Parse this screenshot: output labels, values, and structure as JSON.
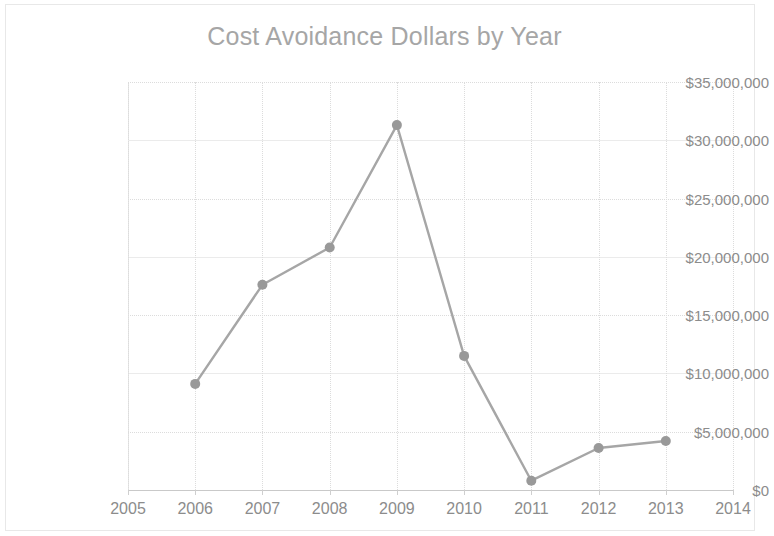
{
  "chart_data": {
    "type": "line",
    "title": "Cost Avoidance Dollars by Year",
    "xlabel": "",
    "ylabel": "",
    "x": [
      2006,
      2007,
      2008,
      2009,
      2010,
      2011,
      2012,
      2013
    ],
    "values": [
      9100000,
      17600000,
      20800000,
      31300000,
      11500000,
      800000,
      3600000,
      4200000
    ],
    "series": [
      {
        "name": "Cost Avoidance Dollars",
        "values": [
          9100000,
          17600000,
          20800000,
          31300000,
          11500000,
          800000,
          3600000,
          4200000
        ]
      }
    ],
    "x_tick_labels": [
      "2005",
      "2006",
      "2007",
      "2008",
      "2009",
      "2010",
      "2011",
      "2012",
      "2013",
      "2014"
    ],
    "y_tick_labels": [
      "$0",
      "$5,000,000",
      "$10,000,000",
      "$15,000,000",
      "$20,000,000",
      "$25,000,000",
      "$30,000,000",
      "$35,000,000"
    ],
    "y_tick_values": [
      0,
      5000000,
      10000000,
      15000000,
      20000000,
      25000000,
      30000000,
      35000000
    ],
    "xlim": [
      2005,
      2014
    ],
    "ylim": [
      0,
      35000000
    ],
    "grid": true,
    "legend": false,
    "legend_position": "none",
    "line_color": "#a6a6a6",
    "marker_color": "#999999",
    "marker_shape": "circle",
    "grid_color": "#dcdcdc",
    "text_color": "#8c8c8c",
    "background_color": "#ffffff"
  }
}
